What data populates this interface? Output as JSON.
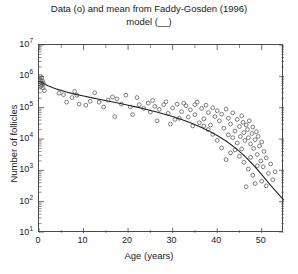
{
  "chart_data": {
    "type": "scatter",
    "title": "Data (o) and mean from Faddy-Gosden (1996) model (__)",
    "title_line1": "Data (o) and mean from Faddy-Gosden (1996)",
    "title_line2": "model (__)",
    "xlabel": "Age (years)",
    "ylabel": "Number of follicles",
    "xscale": "linear",
    "yscale": "log",
    "xlim": [
      0,
      55
    ],
    "ylim": [
      10,
      10000000
    ],
    "grid": false,
    "legend": "none",
    "marker": "open-circle",
    "marker_color": "#555555",
    "line_color": "#222222",
    "xticks": [
      0,
      10,
      20,
      30,
      40,
      50
    ],
    "xtick_labels": [
      "0",
      "10",
      "20",
      "30",
      "40",
      "50"
    ],
    "yticks": [
      10,
      100,
      1000,
      10000,
      100000,
      1000000,
      10000000
    ],
    "ytick_labels": [
      "10^1",
      "10^2",
      "10^3",
      "10^4",
      "10^5",
      "10^6",
      "10^7"
    ],
    "ytick_mantissa": [
      "10",
      "10",
      "10",
      "10",
      "10",
      "10",
      "10"
    ],
    "ytick_exponent": [
      "1",
      "2",
      "3",
      "4",
      "5",
      "6",
      "7"
    ],
    "series": [
      {
        "name": "Data (o)",
        "type": "scatter",
        "points": [
          [
            0.3,
            1000000
          ],
          [
            0.4,
            760000
          ],
          [
            0.5,
            620000
          ],
          [
            0.6,
            900000
          ],
          [
            0.7,
            520000
          ],
          [
            0.8,
            700000
          ],
          [
            0.9,
            430000
          ],
          [
            1.0,
            600000
          ],
          [
            1.2,
            350000
          ],
          [
            0.45,
            480000
          ],
          [
            5.5,
            260000
          ],
          [
            6.2,
            150000
          ],
          [
            7.4,
            210000
          ],
          [
            8.5,
            250000
          ],
          [
            9.0,
            130000
          ],
          [
            10.5,
            120000
          ],
          [
            11.5,
            160000
          ],
          [
            13.5,
            150000
          ],
          [
            14.5,
            105000
          ],
          [
            15.5,
            175000
          ],
          [
            16.5,
            220000
          ],
          [
            17.5,
            190000
          ],
          [
            18.5,
            130000
          ],
          [
            19.5,
            250000
          ],
          [
            20.5,
            105000
          ],
          [
            21.0,
            60000
          ],
          [
            17.0,
            52000
          ],
          [
            22.5,
            125000
          ],
          [
            23.5,
            95000
          ],
          [
            24.5,
            140000
          ],
          [
            25.0,
            72000
          ],
          [
            26.0,
            110000
          ],
          [
            27.0,
            88000
          ],
          [
            28.0,
            125000
          ],
          [
            29.0,
            66000
          ],
          [
            30.0,
            98000
          ],
          [
            30.5,
            42000
          ],
          [
            31.0,
            130000
          ],
          [
            32.0,
            75000
          ],
          [
            33.0,
            115000
          ],
          [
            33.5,
            50000
          ],
          [
            34.0,
            85000
          ],
          [
            35.0,
            60000
          ],
          [
            35.5,
            150000
          ],
          [
            36.0,
            33000
          ],
          [
            36.5,
            95000
          ],
          [
            37.0,
            44000
          ],
          [
            37.5,
            120000
          ],
          [
            38.0,
            70000
          ],
          [
            38.5,
            28000
          ],
          [
            39.0,
            100000
          ],
          [
            39.5,
            52000
          ],
          [
            40.0,
            80000
          ],
          [
            40.5,
            38000
          ],
          [
            41.0,
            62000
          ],
          [
            41.5,
            22000
          ],
          [
            42.0,
            90000
          ],
          [
            42.5,
            46000
          ],
          [
            43.0,
            30000
          ],
          [
            43.5,
            68000
          ],
          [
            44.0,
            18000
          ],
          [
            44.5,
            42000
          ],
          [
            45.0,
            25000
          ],
          [
            45.2,
            12000
          ],
          [
            45.5,
            55000
          ],
          [
            45.8,
            34000
          ],
          [
            46.0,
            16000
          ],
          [
            46.2,
            9000
          ],
          [
            46.5,
            28000
          ],
          [
            46.8,
            20000
          ],
          [
            47.0,
            11000
          ],
          [
            47.2,
            38000
          ],
          [
            47.5,
            7000
          ],
          [
            47.8,
            15000
          ],
          [
            48.0,
            24000
          ],
          [
            48.2,
            5000
          ],
          [
            48.5,
            9500
          ],
          [
            48.8,
            17000
          ],
          [
            49.0,
            3200
          ],
          [
            49.2,
            12000
          ],
          [
            49.5,
            6000
          ],
          [
            49.8,
            2000
          ],
          [
            50.0,
            8000
          ],
          [
            50.3,
            1300
          ],
          [
            50.5,
            4000
          ],
          [
            51.0,
            2500
          ],
          [
            51.5,
            800
          ],
          [
            52.0,
            1600
          ],
          [
            52.5,
            500
          ],
          [
            53.0,
            900
          ],
          [
            44.0,
            4500
          ],
          [
            45.0,
            2800
          ],
          [
            46.0,
            1800
          ],
          [
            47.0,
            1100
          ],
          [
            43.0,
            3600
          ],
          [
            41.0,
            5200
          ],
          [
            42.0,
            2200
          ],
          [
            48.0,
            700
          ],
          [
            49.0,
            1400
          ],
          [
            50.0,
            450
          ],
          [
            51.0,
            320
          ],
          [
            46.5,
            300
          ],
          [
            48.5,
            380
          ],
          [
            40.0,
            9000
          ],
          [
            39.0,
            14000
          ],
          [
            38.0,
            20000
          ],
          [
            37.0,
            26000
          ],
          [
            44.5,
            7500
          ],
          [
            43.5,
            11000
          ],
          [
            42.5,
            13500
          ],
          [
            45.5,
            4800
          ],
          [
            47.5,
            2600
          ],
          [
            26.5,
            38000
          ],
          [
            29.5,
            30000
          ],
          [
            31.5,
            46000
          ],
          [
            34.5,
            26000
          ],
          [
            12.5,
            300000
          ],
          [
            8.0,
            330000
          ],
          [
            4.5,
            290000
          ],
          [
            22.0,
            210000
          ],
          [
            25.5,
            170000
          ],
          [
            28.5,
            155000
          ],
          [
            32.5,
            140000
          ],
          [
            35.0,
            125000
          ]
        ]
      },
      {
        "name": "Faddy-Gosden (1996) model mean (__)",
        "type": "line",
        "points": [
          [
            0,
            700000
          ],
          [
            2,
            500000
          ],
          [
            4,
            390000
          ],
          [
            6,
            320000
          ],
          [
            8,
            270000
          ],
          [
            10,
            235000
          ],
          [
            12,
            205000
          ],
          [
            14,
            180000
          ],
          [
            16,
            158000
          ],
          [
            18,
            138000
          ],
          [
            20,
            120000
          ],
          [
            22,
            104000
          ],
          [
            24,
            89000
          ],
          [
            26,
            75000
          ],
          [
            28,
            63000
          ],
          [
            30,
            52000
          ],
          [
            32,
            42000
          ],
          [
            34,
            33000
          ],
          [
            36,
            25000
          ],
          [
            38,
            18500
          ],
          [
            40,
            13000
          ],
          [
            42,
            8600
          ],
          [
            44,
            5300
          ],
          [
            46,
            3000
          ],
          [
            48,
            1550
          ],
          [
            50,
            730
          ],
          [
            52,
            330
          ],
          [
            54,
            160
          ],
          [
            55,
            110
          ]
        ]
      }
    ]
  }
}
